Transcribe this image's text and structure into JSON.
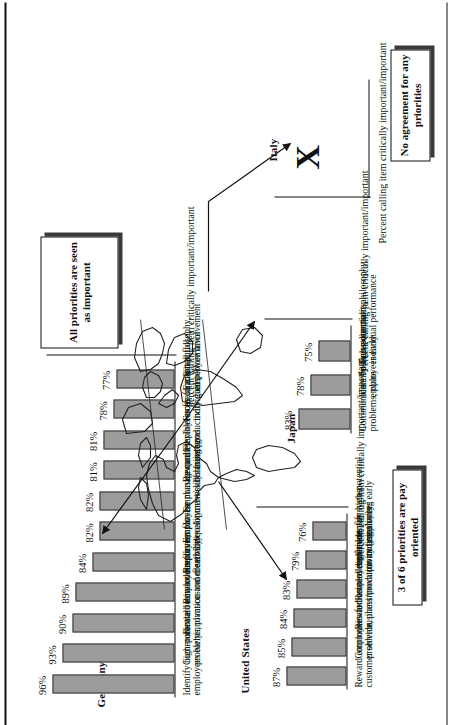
{
  "figure": {
    "axis_caption": "Percent calling item critically important/important",
    "map_icon": "world-map-outline",
    "no_data_marker": "X"
  },
  "panels": [
    {
      "id": "germany",
      "country": "Germany",
      "callout": "All priorities are seen as important",
      "axis_caption": "Percent calling item critically important/important",
      "items": [
        {
          "label": "Identify high-potential employees early",
          "value": 96,
          "value_label": "96%"
        },
        {
          "label": "Communicate business directions, problems, plans",
          "value": 93,
          "value_label": "93%"
        },
        {
          "label": "Reward employees for innovation and creativity",
          "value": 90,
          "value_label": "90%"
        },
        {
          "label": "Reward employees for customer service/quality",
          "value": 89,
          "value_label": "89%"
        },
        {
          "label": "Require employee flexibility",
          "value": 84,
          "value_label": "84%"
        },
        {
          "label": "Emphasize management development/skills training",
          "value": 82,
          "value_label": "82%"
        },
        {
          "label": "Emphasize quality university hiring",
          "value": 82,
          "value_label": "82%"
        },
        {
          "label": "Reward employees for business/productivity gains",
          "value": 81,
          "value_label": "81%"
        },
        {
          "label": "Flexible cross-functional teams",
          "value": 81,
          "value_label": "81%"
        },
        {
          "label": "Focus on merit philosophy, individual performance",
          "value": 78,
          "value_label": "78%"
        },
        {
          "label": "Facilitate full employee involvement",
          "value": 77,
          "value_label": "77%"
        }
      ]
    },
    {
      "id": "japan",
      "country": "Japan",
      "callout": null,
      "axis_caption": "Percent calling item critically important/important",
      "items": [
        {
          "label": "Communicate business directions, problems, plans",
          "value": 83,
          "value_label": "83%"
        },
        {
          "label": "Identify high-potential employees early",
          "value": 78,
          "value_label": "78%"
        },
        {
          "label": "Focus on merit philosophy, individual performance",
          "value": 75,
          "value_label": "75%"
        }
      ]
    },
    {
      "id": "united-states",
      "country": "United States",
      "callout": "3 of 6 priorities are pay oriented",
      "axis_caption": "Percent calling item critically important/important",
      "items": [
        {
          "label": "Reward employees for customer service",
          "value": 87,
          "value_label": "87%"
        },
        {
          "label": "Communicate business directions, problems, plans",
          "value": 85,
          "value_label": "85%"
        },
        {
          "label": "Reward employees for business/productivity gains",
          "value": 84,
          "value_label": "84%"
        },
        {
          "label": "Reward employees for innovation and creativity",
          "value": 83,
          "value_label": "83%"
        },
        {
          "label": "Implement pay system promoting sharing",
          "value": 79,
          "value_label": "79%"
        },
        {
          "label": "Identify high-potential employees early",
          "value": 76,
          "value_label": "76%"
        }
      ]
    },
    {
      "id": "italy",
      "country": "Italy",
      "callout": "No agreement for any priorities",
      "axis_caption": "Percent calling item critically important/important",
      "items": []
    }
  ],
  "chart_data": {
    "type": "bar",
    "ylabel": "Percent calling item critically important/important",
    "xlabel": "",
    "ylim": [
      0,
      100
    ],
    "grid": false,
    "legend": "none",
    "panels": [
      {
        "name": "Germany",
        "annotation": "All priorities are seen as important",
        "categories": [
          "Identify high-potential employees early",
          "Communicate business directions, problems, plans",
          "Reward employees for innovation and creativity",
          "Reward employees for customer service/quality",
          "Require employee flexibility",
          "Emphasize management development/skills training",
          "Emphasize quality university hiring",
          "Reward employees for business/productivity gains",
          "Flexible cross-functional teams",
          "Focus on merit philosophy, individual performance",
          "Facilitate full employee involvement"
        ],
        "values": [
          96,
          93,
          90,
          89,
          84,
          82,
          82,
          81,
          81,
          78,
          77
        ]
      },
      {
        "name": "Japan",
        "annotation": "",
        "categories": [
          "Communicate business directions, problems, plans",
          "Identify high-potential employees early",
          "Focus on merit philosophy, individual performance"
        ],
        "values": [
          83,
          78,
          75
        ]
      },
      {
        "name": "United States",
        "annotation": "3 of 6 priorities are pay oriented",
        "categories": [
          "Reward employees for customer service",
          "Communicate business directions, problems, plans",
          "Reward employees for business/productivity gains",
          "Reward employees for innovation and creativity",
          "Implement pay system promoting sharing",
          "Identify high-potential employees early"
        ],
        "values": [
          87,
          85,
          84,
          83,
          79,
          76
        ]
      },
      {
        "name": "Italy",
        "annotation": "No agreement for any priorities",
        "categories": [],
        "values": []
      }
    ]
  }
}
